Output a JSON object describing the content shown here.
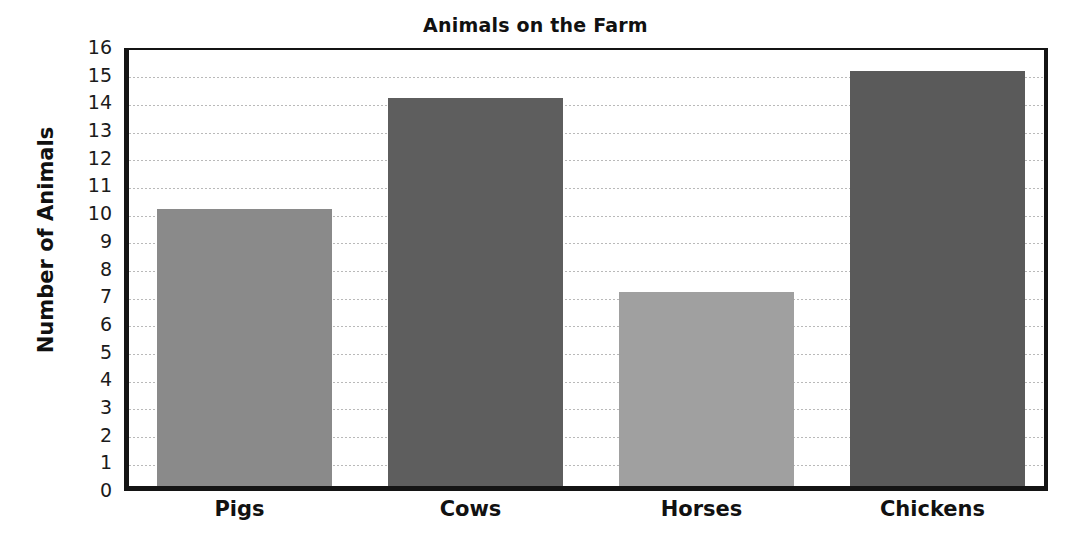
{
  "chart_data": {
    "type": "bar",
    "title": "Animals on the Farm",
    "xlabel": "",
    "ylabel": "Number of Animals",
    "categories": [
      "Pigs",
      "Cows",
      "Horses",
      "Chickens"
    ],
    "values": [
      10,
      14,
      7,
      15
    ],
    "ylim": [
      0,
      16
    ],
    "ytick_step": 1,
    "yticks": [
      "16",
      "15",
      "14",
      "13",
      "12",
      "11",
      "10",
      "9",
      "8",
      "7",
      "6",
      "5",
      "4",
      "3",
      "2",
      "1",
      "0"
    ],
    "grid": true,
    "legend": "none",
    "bar_colors": [
      "#8a8a8a",
      "#5e5e5e",
      "#a0a0a0",
      "#5a5a5a"
    ],
    "axis_color": "#141414",
    "grid_color": "#b9b9b9",
    "background_color": "#ffffff"
  }
}
